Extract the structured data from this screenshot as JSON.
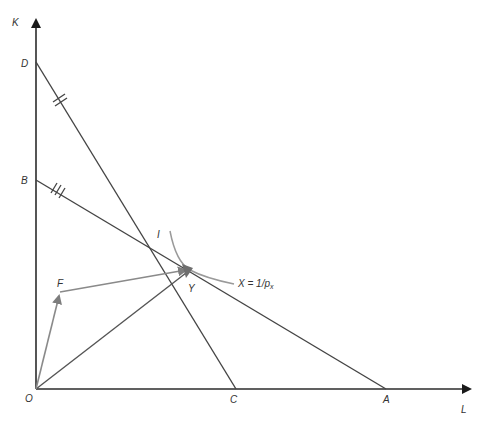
{
  "diagram": {
    "axes": {
      "y_label": "K",
      "x_label": "L",
      "origin_label": "O"
    },
    "points": {
      "D": "D",
      "B": "B",
      "C": "C",
      "A": "A",
      "I": "I",
      "Y": "Y",
      "F": "F"
    },
    "isoquant_label": "X = 1/p",
    "isoquant_subscript": "x",
    "tick_marks": {
      "DC": "double",
      "BA": "triple"
    },
    "colors": {
      "axis": "#2b2b2b",
      "lines": "#444444",
      "vectors": "#8a8a8a",
      "curve": "#9a9a9a"
    }
  }
}
